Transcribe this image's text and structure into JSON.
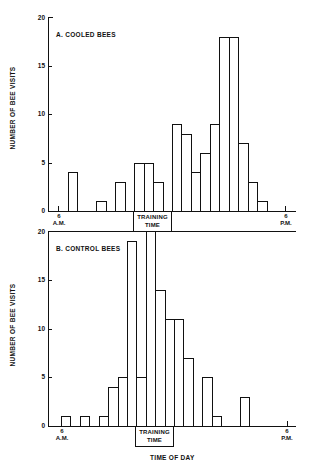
{
  "chart_data": [
    {
      "type": "bar",
      "title": "A. COOLED BEES",
      "xlabel": "TIME OF DAY",
      "ylabel": "NUMBER OF BEE VISITS",
      "ylim": [
        0,
        20
      ],
      "yticks": [
        0,
        5,
        10,
        15,
        20
      ],
      "x_tick_labels": [
        "6 A.M.",
        "6 P.M."
      ],
      "bin_width": "30 min",
      "annotation": "TRAINING TIME",
      "training_slots": [
        8,
        11
      ],
      "categories": [
        "6:00",
        "6:30",
        "7:00",
        "7:30",
        "8:00",
        "8:30",
        "9:00",
        "9:30",
        "10:00",
        "10:30",
        "11:00",
        "11:30",
        "12:00",
        "12:30",
        "13:00",
        "13:30",
        "14:00",
        "14:30",
        "15:00",
        "15:30",
        "16:00",
        "16:30",
        "17:00",
        "17:30"
      ],
      "values": [
        0,
        4,
        0,
        0,
        1,
        0,
        3,
        0,
        5,
        5,
        3,
        0,
        9,
        8,
        4,
        6,
        9,
        18,
        18,
        7,
        3,
        1,
        0,
        0
      ]
    },
    {
      "type": "bar",
      "title": "B. CONTROL BEES",
      "xlabel": "TIME OF DAY",
      "ylabel": "NUMBER OF BEE VISITS",
      "ylim": [
        0,
        20
      ],
      "yticks": [
        0,
        5,
        10,
        15,
        20
      ],
      "x_tick_labels": [
        "6 A.M.",
        "6 P.M."
      ],
      "bin_width": "30 min",
      "annotation": "TRAINING TIME",
      "training_slots": [
        8,
        11
      ],
      "categories": [
        "6:00",
        "6:30",
        "7:00",
        "7:30",
        "8:00",
        "8:30",
        "9:00",
        "9:30",
        "10:00",
        "10:30",
        "11:00",
        "11:30",
        "12:00",
        "12:30",
        "13:00",
        "13:30",
        "14:00",
        "14:30",
        "15:00",
        "15:30",
        "16:00",
        "16:30",
        "17:00",
        "17:30"
      ],
      "values": [
        1,
        0,
        1,
        0,
        1,
        4,
        5,
        19,
        5,
        20,
        14,
        11,
        11,
        7,
        0,
        5,
        1,
        0,
        0,
        3,
        0,
        0,
        0,
        0
      ]
    }
  ],
  "panels": {
    "a": {
      "title": "A. COOLED BEES",
      "ylabel": "NUMBER OF BEE VISITS",
      "yticks": [
        "0",
        "5",
        "10",
        "15",
        "20"
      ],
      "am_num": "6",
      "am_label": "A.M.",
      "pm_num": "6",
      "pm_label": "P.M.",
      "training_line1": "TRAINING",
      "training_line2": "TIME"
    },
    "b": {
      "title": "B. CONTROL BEES",
      "ylabel": "NUMBER OF BEE VISITS",
      "yticks": [
        "0",
        "5",
        "10",
        "15",
        "20"
      ],
      "am_num": "6",
      "am_label": "A.M.",
      "pm_num": "6",
      "pm_label": "P.M.",
      "training_line1": "TRAINING",
      "training_line2": "TIME",
      "xlabel": "TIME OF DAY"
    }
  }
}
